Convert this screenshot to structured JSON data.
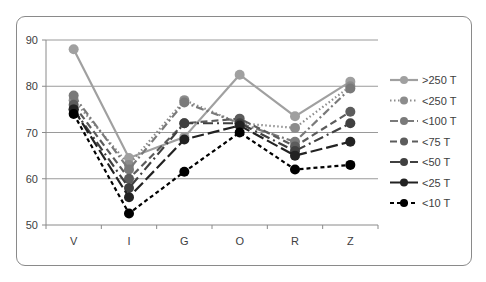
{
  "chart_data": {
    "type": "line",
    "title": "",
    "xlabel": "",
    "ylabel": "",
    "categories": [
      "V",
      "I",
      "G",
      "O",
      "R",
      "Z"
    ],
    "ylim": [
      50,
      90
    ],
    "yticks": [
      50,
      60,
      70,
      80,
      90
    ],
    "grid": "horizontal",
    "legend_position": "right",
    "series": [
      {
        "name": ">250 T",
        "values": [
          88,
          64.5,
          69,
          82.5,
          73.5,
          81
        ],
        "color": "#a0a0a0",
        "dash": "none"
      },
      {
        "name": "<250 T",
        "values": [
          77,
          63,
          77,
          72,
          71,
          80
        ],
        "color": "#8c8c8c",
        "dash": "1.5,2.5"
      },
      {
        "name": "<100 T",
        "values": [
          78,
          62,
          76.5,
          72,
          68,
          79.5
        ],
        "color": "#7a7a7a",
        "dash": "8,3,2,3"
      },
      {
        "name": "<75 T",
        "values": [
          76,
          60,
          72,
          73,
          67,
          74.5
        ],
        "color": "#5c5c5c",
        "dash": "7,4"
      },
      {
        "name": "<50 T",
        "values": [
          75,
          58,
          72,
          72,
          66,
          72
        ],
        "color": "#404040",
        "dash": "10,4,2,4"
      },
      {
        "name": "<25 T",
        "values": [
          75,
          56,
          68.5,
          71.5,
          65,
          68
        ],
        "color": "#222222",
        "dash": "12,4"
      },
      {
        "name": "<10 T",
        "values": [
          74,
          52.5,
          61.5,
          70,
          62,
          63
        ],
        "color": "#000000",
        "dash": "4,3"
      }
    ]
  }
}
